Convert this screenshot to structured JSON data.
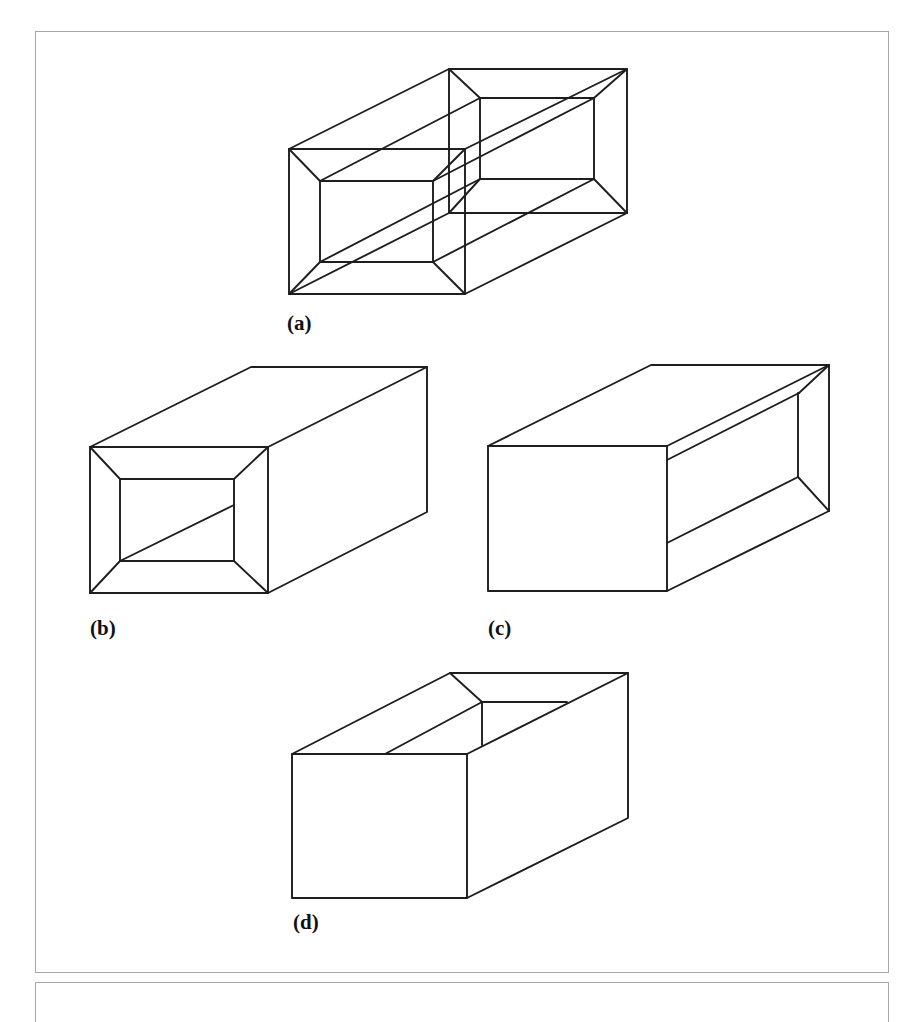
{
  "figure": {
    "panels": [
      {
        "id": "a",
        "label": "(a)",
        "description": "Transparent wireframe hollow box with inner tunnel and beveled openings at both ends"
      },
      {
        "id": "b",
        "label": "(b)",
        "description": "Solid box with beveled rectangular opening on front face"
      },
      {
        "id": "c",
        "label": "(c)",
        "description": "Solid box with beveled rectangular opening on right side face"
      },
      {
        "id": "d",
        "label": "(d)",
        "description": "Solid box with rectangular opening on top face"
      }
    ]
  },
  "style": {
    "stroke_color": "#1e1e1e",
    "frame_color": "#a8a8a8",
    "background": "#ffffff"
  }
}
